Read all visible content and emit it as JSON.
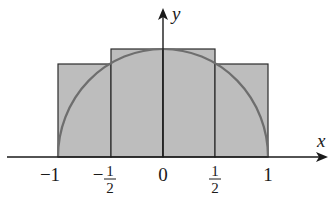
{
  "diagram": {
    "type": "riemann-sum-semicircle",
    "function": "y = sqrt(1 - x^2)",
    "colors": {
      "fill": "#bdbdbd",
      "rect_stroke": "#2b2b2b",
      "curve": "#6e6e6e",
      "axis": "#1a1a1a",
      "background": "#ffffff"
    },
    "axes": {
      "x_label": "x",
      "y_label": "y"
    },
    "ticks": [
      {
        "value": -1,
        "label": "−1"
      },
      {
        "value": -0.5,
        "sign": "−",
        "num": "1",
        "den": "2"
      },
      {
        "value": 0,
        "label": "0"
      },
      {
        "value": 0.5,
        "num": "1",
        "den": "2"
      },
      {
        "value": 1,
        "label": "1"
      }
    ],
    "rectangles": [
      {
        "x0": -1,
        "x1": -0.5,
        "height": 0.866
      },
      {
        "x0": -0.5,
        "x1": 0,
        "height": 1
      },
      {
        "x0": 0,
        "x1": 0.5,
        "height": 1
      },
      {
        "x0": 0.5,
        "x1": 1,
        "height": 0.866
      }
    ]
  }
}
